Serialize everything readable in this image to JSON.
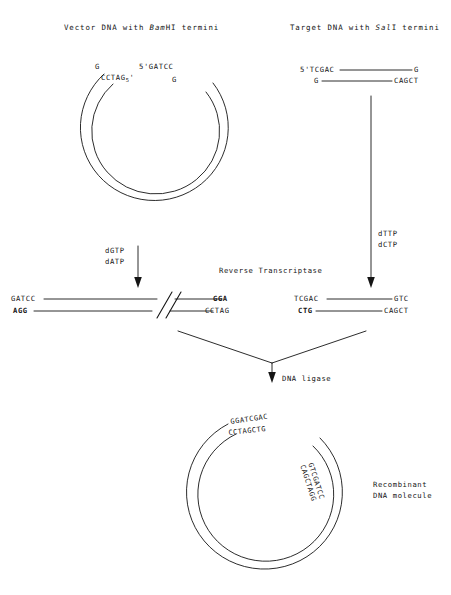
{
  "figure": {
    "title_left": "Vector DNA with ",
    "title_left_enzyme": "Bam",
    "title_left_enzyme_tail": "HI termini",
    "title_right": "Target DNA with ",
    "title_right_enzyme": "Sal",
    "title_right_enzyme_tail": "I termini"
  },
  "vector_circle": {
    "left_top_base": "G",
    "left_overhang": "CCTAG",
    "left_overhang_sub": "5",
    "left_overhang_prime": "'",
    "right_overhang": "5'GATCC",
    "right_base": "G"
  },
  "target_duplex": {
    "top_left": "5'TCGAC",
    "top_right": "G",
    "bottom_left": "G",
    "bottom_right": "CAGCT"
  },
  "arrows": {
    "left_label_line1": "dGTP",
    "left_label_line2": "dATP",
    "right_label_line1": "dTTP",
    "right_label_line2": "dCTP",
    "enzyme_label": "Reverse Transcriptase",
    "ligase_label": "DNA ligase"
  },
  "vector_linear": {
    "top_left": "GATCC",
    "bottom_left": "AGG",
    "top_right": "GGA",
    "bottom_right": "CCTAG"
  },
  "target_linear": {
    "top_left": "TCGAC",
    "bottom_left": "CTG",
    "top_right": "GTC",
    "bottom_right": "CAGCT"
  },
  "recombinant": {
    "top_strand": "GGATCGAC",
    "bottom_strand": "CCTAGCTG",
    "side_strand_outer": "GTCGATCC",
    "side_strand_inner": "CAGCTAGG",
    "label_line1": "Recombinant",
    "label_line2": "DNA molecule"
  },
  "colors": {
    "ink": "#141414",
    "background": "#ffffff"
  }
}
